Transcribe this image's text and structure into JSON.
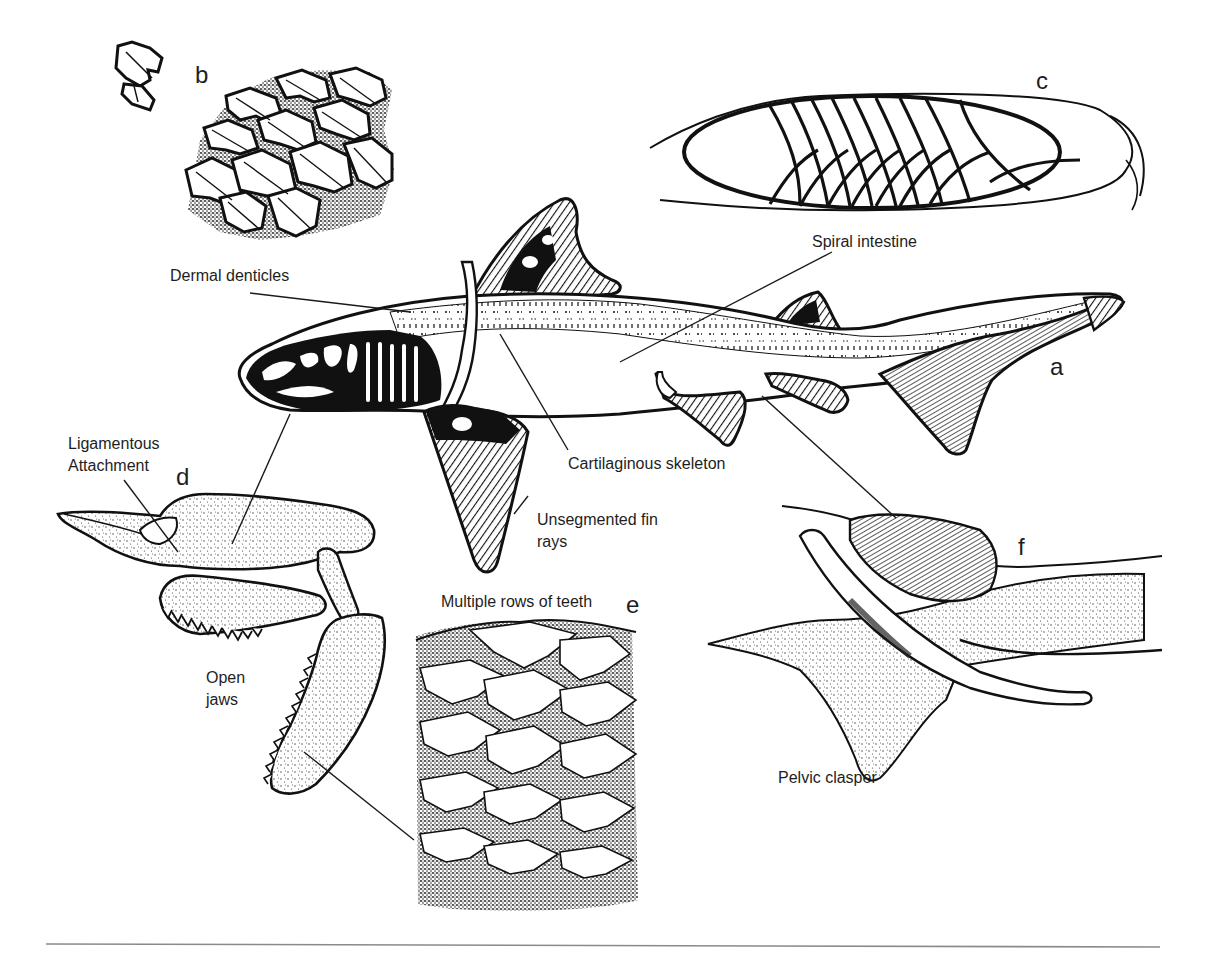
{
  "figure": {
    "panels": [
      {
        "id": "a",
        "letter": "a",
        "subject": "whole shark, cartilaginous skeleton cutaway"
      },
      {
        "id": "b",
        "letter": "b",
        "subject": "dermal denticles (placoid scales)"
      },
      {
        "id": "c",
        "letter": "c",
        "subject": "spiral intestine"
      },
      {
        "id": "d",
        "letter": "d",
        "subject": "jaws with ligamentous attachment"
      },
      {
        "id": "e",
        "letter": "e",
        "subject": "multiple rows of teeth"
      },
      {
        "id": "f",
        "letter": "f",
        "subject": "pelvic clasper"
      }
    ],
    "labels": {
      "dermal_denticles": "Dermal denticles",
      "spiral_intestine": "Spiral intestine",
      "cartilaginous_skeleton": "Cartilaginous skeleton",
      "unsegmented_fin_rays_line1": "Unsegmented fin",
      "unsegmented_fin_rays_line2": "rays",
      "ligamentous_line1": "Ligamentous",
      "ligamentous_line2": "Attachment",
      "open_jaws_line1": "Open",
      "open_jaws_line2": "jaws",
      "multiple_rows_of_teeth": "Multiple rows of teeth",
      "pelvic_clasper": "Pelvic clasper"
    },
    "colors": {
      "ink": "#111111",
      "label_text": "#1e1e1e",
      "background": "#ffffff",
      "rule": "#8a8a8a"
    }
  }
}
